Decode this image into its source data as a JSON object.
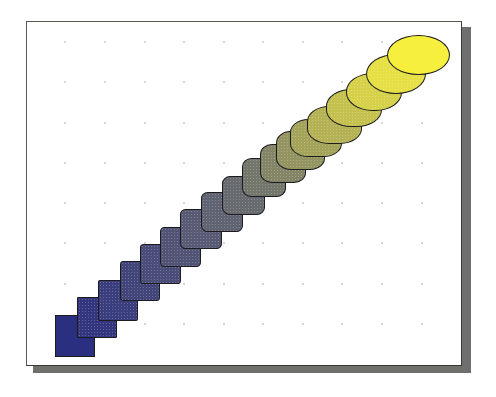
{
  "figure": {
    "title": "Blend: square to ellipse, blue to yellow",
    "start_shape": "square",
    "end_shape": "ellipse",
    "start_color": "#2b2f80",
    "mid_color": "#6b6e6e",
    "end_color": "#f6ef3e",
    "outline_color": "#1c1c20",
    "frame_shadow_color": "#6f706c",
    "grid": {
      "columns_x": [
        65,
        105,
        145,
        184,
        224,
        263,
        303,
        342,
        382,
        422
      ],
      "rows_y": [
        42,
        82,
        123,
        163,
        203,
        243,
        284,
        324
      ],
      "dot_color": "#c9c9c4"
    },
    "steps": [
      {
        "cx": 75,
        "cy": 336,
        "w": 40,
        "h": 42,
        "radius": "0%"
      },
      {
        "cx": 97,
        "cy": 317,
        "w": 40,
        "h": 41,
        "radius": "3%"
      },
      {
        "cx": 118,
        "cy": 300,
        "w": 40,
        "h": 41,
        "radius": "5%"
      },
      {
        "cx": 140,
        "cy": 281,
        "w": 40,
        "h": 40,
        "radius": "7%"
      },
      {
        "cx": 160,
        "cy": 264,
        "w": 41,
        "h": 40,
        "radius": "9%"
      },
      {
        "cx": 180,
        "cy": 247,
        "w": 41,
        "h": 40,
        "radius": "11%"
      },
      {
        "cx": 201,
        "cy": 229,
        "w": 42,
        "h": 40,
        "radius": "13%"
      },
      {
        "cx": 222,
        "cy": 212,
        "w": 42,
        "h": 40,
        "radius": "16%"
      },
      {
        "cx": 243,
        "cy": 195,
        "w": 43,
        "h": 39,
        "radius": "19%"
      },
      {
        "cx": 264,
        "cy": 177,
        "w": 44,
        "h": 39,
        "radius": "22%"
      },
      {
        "cx": 283,
        "cy": 163,
        "w": 46,
        "h": 39,
        "radius": "26%"
      },
      {
        "cx": 300,
        "cy": 150,
        "w": 49,
        "h": 39,
        "radius": "30%"
      },
      {
        "cx": 316,
        "cy": 138,
        "w": 52,
        "h": 38,
        "radius": "35%"
      },
      {
        "cx": 334,
        "cy": 125,
        "w": 55,
        "h": 38,
        "radius": "40%"
      },
      {
        "cx": 354,
        "cy": 108,
        "w": 56,
        "h": 38,
        "radius": "45%"
      },
      {
        "cx": 374,
        "cy": 92,
        "w": 56,
        "h": 38,
        "radius": "48%"
      },
      {
        "cx": 396,
        "cy": 74,
        "w": 60,
        "h": 40,
        "radius": "50%"
      },
      {
        "cx": 418,
        "cy": 55,
        "w": 63,
        "h": 40,
        "radius": "50%"
      }
    ]
  }
}
